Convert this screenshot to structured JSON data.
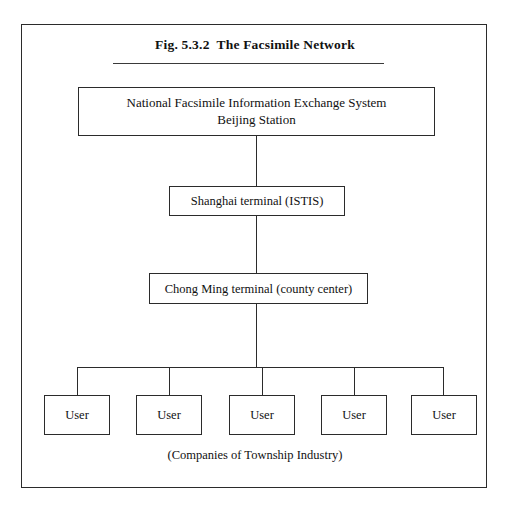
{
  "figure": {
    "title": "Fig. 5.3.2  The Facsimile Network",
    "caption": "(Companies of Township Industry)"
  },
  "nodes": {
    "root": {
      "label": "National Facsimile Information Exchange System\nBeijing Station",
      "name": "national-facsimile-information-exchange-system-beijing-station"
    },
    "shanghai": {
      "label": "Shanghai  terminal  (ISTIS)",
      "name": "shanghai-terminal-istis"
    },
    "chongming": {
      "label": "Chong Ming terminal (county center)",
      "name": "chong-ming-terminal-county-center"
    },
    "users": [
      {
        "label": "User"
      },
      {
        "label": "User"
      },
      {
        "label": "User"
      },
      {
        "label": "User"
      },
      {
        "label": "User"
      }
    ]
  },
  "colors": {
    "ink": "#111111",
    "stroke": "#2b2b2b",
    "rule": "#3a3a3a",
    "background": "#ffffff"
  }
}
